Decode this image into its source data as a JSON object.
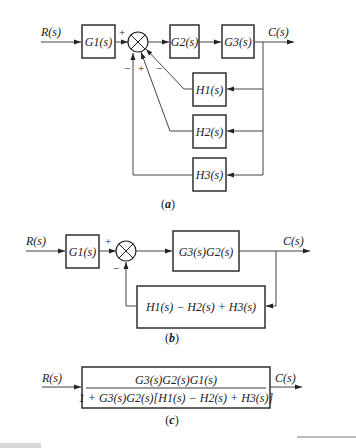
{
  "diagram_a": {
    "input": "R(s)",
    "output": "C(s)",
    "blocks": {
      "g1": "G1(s)",
      "g2": "G2(s)",
      "g3": "G3(s)",
      "h1": "H1(s)",
      "h2": "H2(s)",
      "h3": "H3(s)"
    },
    "signs": {
      "main_in": "+",
      "h3_in": "−",
      "h2_in": "+",
      "h1_in": "−"
    },
    "caption_open": "(",
    "caption_letter": "a",
    "caption_close": ")"
  },
  "diagram_b": {
    "input": "R(s)",
    "output": "C(s)",
    "blocks": {
      "g1": "G1(s)",
      "forward": "G3(s)G2(s)",
      "feedback": "H1(s) − H2(s) + H3(s)"
    },
    "signs": {
      "main_in": "+",
      "fb_in": "−"
    },
    "caption_open": "(",
    "caption_letter": "b",
    "caption_close": ")"
  },
  "diagram_c": {
    "input": "R(s)",
    "output": "C(s)",
    "numerator": "G3(s)G2(s)G1(s)",
    "denominator": "1 + G3(s)G2(s)[H1(s) − H2(s) + H3(s)]",
    "caption_open": "(",
    "caption_letter": "c",
    "caption_close": ")"
  },
  "colors": {
    "line": "#444444",
    "box": "#222222",
    "text": "#222222"
  }
}
